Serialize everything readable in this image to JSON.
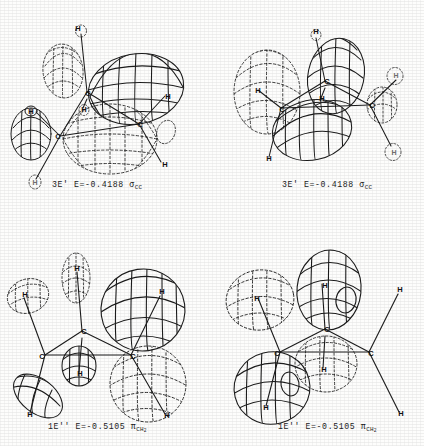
{
  "figure": {
    "type": "molecular-orbital-contour-plots",
    "molecule": "cyclopropane",
    "panel_count": 4,
    "background_color": "#fdfdfc",
    "ink_color": "#1c1c1c",
    "phase_solid_note": "solid mesh lobe",
    "phase_dashed_note": "dashed mesh lobe"
  },
  "panels": [
    {
      "id": "top-left",
      "caption": {
        "orbital": "3E'",
        "energy_label": "E=-0.4188",
        "symmetry_symbol": "σ",
        "symmetry_subscript": "CC",
        "full": "3E' E=-0.4188 σCC"
      },
      "atom_labels": [
        "H",
        "C",
        "H",
        "C",
        "H",
        "C",
        "H"
      ]
    },
    {
      "id": "top-right",
      "caption": {
        "orbital": "3E'",
        "energy_label": "E=-0.4188",
        "symmetry_symbol": "σ",
        "symmetry_subscript": "CC",
        "full": "3E' E=-0.4188 σCC"
      },
      "atom_labels": [
        "H",
        "H",
        "C",
        "H",
        "C",
        "H",
        "H"
      ]
    },
    {
      "id": "bottom-left",
      "caption": {
        "orbital": "1E''",
        "energy_label": "E=-0.5105",
        "symmetry_symbol": "π",
        "symmetry_subscript": "CH",
        "symmetry_subscript_count": "2",
        "full": "1E'' E=-0.5105 πCH2"
      },
      "atom_labels": [
        "H",
        "H",
        "C",
        "C",
        "C",
        "H",
        "H"
      ]
    },
    {
      "id": "bottom-right",
      "caption": {
        "orbital": "1E''",
        "energy_label": "E=-0.5105",
        "symmetry_symbol": "π",
        "symmetry_subscript": "CH",
        "symmetry_subscript_count": "2",
        "full": "1E'' E=-0.5105 πCH2"
      },
      "atom_labels": [
        "H",
        "H",
        "C",
        "C",
        "C",
        "H",
        "H"
      ]
    }
  ]
}
